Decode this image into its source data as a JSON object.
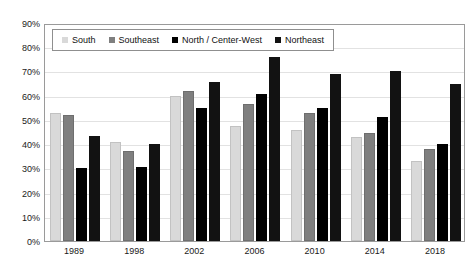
{
  "chart_data": {
    "type": "bar",
    "title": "",
    "xlabel": "",
    "ylabel": "",
    "categories": [
      "1989",
      "1998",
      "2002",
      "2006",
      "2010",
      "2014",
      "2018"
    ],
    "series": [
      {
        "name": "South",
        "color": "#D9D9D9",
        "values": [
          53,
          41,
          60,
          47.5,
          46,
          43,
          33
        ]
      },
      {
        "name": "Southeast",
        "color": "#7F7F7F",
        "values": [
          52,
          37,
          62,
          56.5,
          53,
          44.5,
          38
        ]
      },
      {
        "name": "North / Center-West",
        "color": "#000000",
        "values": [
          30,
          30.5,
          55,
          60.5,
          55,
          51,
          40
        ]
      },
      {
        "name": "Northeast",
        "color": "#121212",
        "values": [
          43.5,
          40,
          65.5,
          76,
          69,
          70,
          65
        ]
      }
    ],
    "ylim": [
      0,
      90
    ],
    "ytick_step": 10,
    "ytick_labels": [
      "0%",
      "10%",
      "20%",
      "30%",
      "40%",
      "50%",
      "60%",
      "70%",
      "80%",
      "90%"
    ],
    "grid": true,
    "legend_position": "top-left",
    "value_suffix": "%"
  },
  "legend": {
    "items": [
      {
        "label": "South",
        "swatch": "south"
      },
      {
        "label": "Southeast",
        "swatch": "southeast"
      },
      {
        "label": "North / Center-West",
        "swatch": "northcw"
      },
      {
        "label": "Northeast",
        "swatch": "northeast"
      }
    ]
  }
}
